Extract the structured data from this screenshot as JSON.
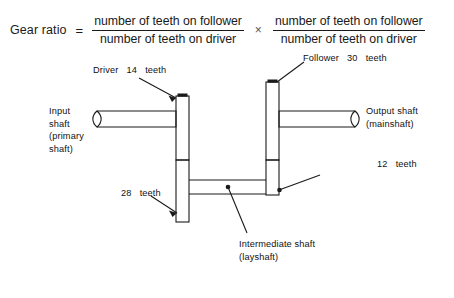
{
  "page": {
    "background_color": "#ffffff",
    "ink_color": "#1a1a1a",
    "width": 454,
    "height": 298
  },
  "formula": {
    "lhs": "Gear ratio",
    "equals": "=",
    "multiply": "×",
    "term1": {
      "numerator": "number of teeth on follower",
      "denominator": "number of teeth on driver"
    },
    "term2": {
      "numerator": "number of teeth on follower",
      "denominator": "number of teeth on driver"
    }
  },
  "annotations": {
    "driver": "Driver   14   teeth",
    "follower": "Follower   30   teeth",
    "input_shaft": "Input\nshaft\n(primary\nshaft)",
    "output_shaft": "Output   shaft\n(mainshaft)",
    "twelve_teeth": "12   teeth",
    "twentyeight_teeth": "28   teeth",
    "intermediate_shaft": "Intermediate   shaft\n(layshaft)"
  },
  "diagram": {
    "type": "mechanical-line-drawing",
    "gears": [
      {
        "name": "driver-gear",
        "teeth": 14,
        "shaft": "input shaft (primary shaft)"
      },
      {
        "name": "follower-gear",
        "teeth": 30,
        "shaft": "output shaft (mainshaft) column"
      },
      {
        "name": "layshaft-gear",
        "teeth": 28,
        "shaft": "intermediate shaft (layshaft)"
      },
      {
        "name": "mainshaft-gear",
        "teeth": 12,
        "shaft": "output shaft (mainshaft)"
      }
    ],
    "shafts": [
      {
        "name": "input-shaft",
        "label": "Input shaft (primary shaft)",
        "orientation": "horizontal",
        "side": "left"
      },
      {
        "name": "output-shaft",
        "label": "Output shaft (mainshaft)",
        "orientation": "horizontal",
        "side": "right"
      },
      {
        "name": "intermediate-shaft",
        "label": "Intermediate shaft (layshaft)",
        "orientation": "horizontal",
        "side": "bottom-center"
      }
    ]
  }
}
